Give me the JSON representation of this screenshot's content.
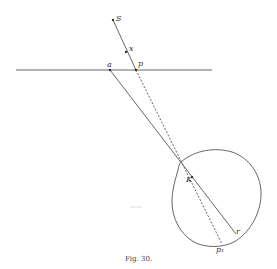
{
  "figure": {
    "caption": "Fig. 30.",
    "labels": {
      "S": "S",
      "x": "x",
      "a": "a",
      "p": "p",
      "K": "K",
      "r": "r",
      "p1": "p₁"
    }
  },
  "geometry": {
    "horizontal_line": {
      "x1": 16,
      "y": 70,
      "x2": 212
    },
    "points": {
      "S": [
        113,
        20
      ],
      "x": [
        126,
        52
      ],
      "a": [
        110,
        70
      ],
      "p": [
        136,
        70
      ],
      "K": [
        192,
        177
      ],
      "r": [
        233,
        232
      ],
      "p1": [
        221,
        245
      ]
    },
    "colors": {
      "ink": "#555555",
      "background": "#ffffff"
    }
  }
}
